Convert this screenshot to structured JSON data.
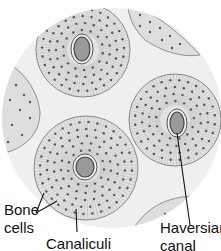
{
  "diagram": {
    "colors": {
      "background": "#ffffff",
      "matrix": "#ececec",
      "osteon_fill": "#e2e2e2",
      "osteon_line": "#7a7a7a",
      "lacuna_dot": "#555555",
      "canal_fill": "#9a9a9a",
      "canal_ring": "#444444",
      "leader_line": "#111111"
    },
    "labels": {
      "bone_cells_line1": "Bone",
      "bone_cells_line2": "cells",
      "canaliculi": "Canaliculi",
      "haversian_line1": "Haversian",
      "haversian_line2": "canal"
    },
    "osteons": [
      {
        "name": "osteon-top-left",
        "cx": 83,
        "cy": 50,
        "r": 47,
        "canal": {
          "cx": 82,
          "cy": 49,
          "rx": 8,
          "ry": 12
        }
      },
      {
        "name": "osteon-right",
        "cx": 175,
        "cy": 120,
        "r": 46,
        "canal": {
          "cx": 177,
          "cy": 123,
          "rx": 7,
          "ry": 11
        }
      },
      {
        "name": "osteon-bottom",
        "cx": 86,
        "cy": 168,
        "r": 52,
        "canal": {
          "cx": 85,
          "cy": 167,
          "rx": 9,
          "ry": 10
        }
      }
    ]
  }
}
